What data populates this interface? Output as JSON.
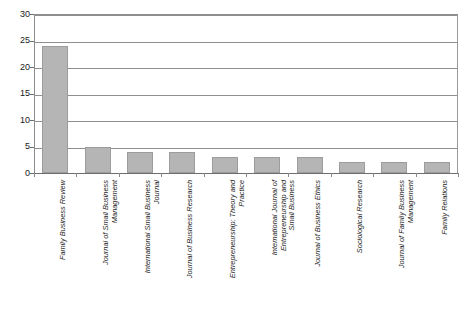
{
  "chart_data": {
    "type": "bar",
    "title": "",
    "subtitle": "",
    "xlabel": "",
    "ylabel": "",
    "ylim": [
      0,
      30
    ],
    "ytick_step": 5,
    "yticks": [
      "0",
      "5",
      "10",
      "15",
      "20",
      "25",
      "30"
    ],
    "grid": true,
    "legend": false,
    "legend_position": "none",
    "orientation": "vertical",
    "bar_color": "#b5b5b5",
    "bar_border_color": "#9c9c9c",
    "axis_color": "#8f8f8f",
    "categories": [
      "Family Business Review",
      "Journal of Small Business Management",
      "International Small Business Journal",
      "Journal of Business Research",
      "Entrepreneurship: Theory and Practice",
      "International Journal of Entrepreneurship and Small Business",
      "Journal of Business Ethics",
      "Sociological Research",
      "Journal of Family Business Management",
      "Family Relations"
    ],
    "category_lines": [
      [
        "Family Business Review"
      ],
      [
        "Journal of Small Business",
        "Management"
      ],
      [
        "International Small Business",
        "Journal"
      ],
      [
        "Journal of Business Research"
      ],
      [
        "Entrepreneurship: Theory and",
        "Practice"
      ],
      [
        "International Journal of",
        "Entrepreneurship and",
        "Small Business"
      ],
      [
        "Journal of Business Ethics"
      ],
      [
        "Sociological Research"
      ],
      [
        "Journal of Family Business",
        "Management"
      ],
      [
        "Family Relations"
      ]
    ],
    "values": [
      24,
      5,
      4,
      4,
      3,
      3,
      3,
      2,
      2,
      2
    ]
  }
}
